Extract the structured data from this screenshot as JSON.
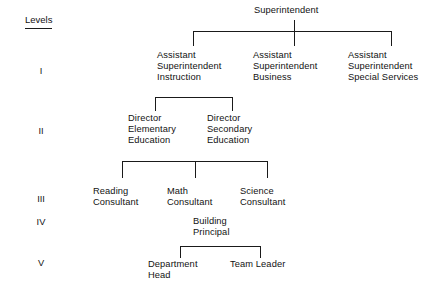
{
  "levels_header": "Levels",
  "levels": [
    {
      "numeral": "I",
      "x": 41,
      "y": 66
    },
    {
      "numeral": "II",
      "x": 41,
      "y": 126
    },
    {
      "numeral": "III",
      "x": 41,
      "y": 194
    },
    {
      "numeral": "IV",
      "x": 41,
      "y": 217
    },
    {
      "numeral": "V",
      "x": 41,
      "y": 258
    }
  ],
  "nodes": [
    {
      "id": "superintendent",
      "label": "Superintendent",
      "x": 254,
      "y": 5,
      "align": "left"
    },
    {
      "id": "asst-supt-instruction",
      "label": "Assistant\nSuperintendent\nInstruction",
      "x": 157,
      "y": 50,
      "align": "left"
    },
    {
      "id": "asst-supt-business",
      "label": "Assistant\nSuperintendent\nBusiness",
      "x": 253,
      "y": 50,
      "align": "left"
    },
    {
      "id": "asst-supt-special-services",
      "label": "Assistant\nSuperintendent\nSpecial Services",
      "x": 348,
      "y": 50,
      "align": "left"
    },
    {
      "id": "director-elementary",
      "label": "Director\nElementary\nEducation",
      "x": 128,
      "y": 113,
      "align": "left"
    },
    {
      "id": "director-secondary",
      "label": "Director\nSecondary\nEducation",
      "x": 207,
      "y": 113,
      "align": "left"
    },
    {
      "id": "reading-consultant",
      "label": "Reading\nConsultant",
      "x": 93,
      "y": 186,
      "align": "left"
    },
    {
      "id": "math-consultant",
      "label": "Math\nConsultant",
      "x": 167,
      "y": 186,
      "align": "left"
    },
    {
      "id": "science-consultant",
      "label": "Science\nConsultant",
      "x": 240,
      "y": 186,
      "align": "left"
    },
    {
      "id": "building-principal",
      "label": "Building\nPrincipal",
      "x": 193,
      "y": 216,
      "align": "left"
    },
    {
      "id": "department-head",
      "label": "Department\nHead",
      "x": 148,
      "y": 259,
      "align": "left"
    },
    {
      "id": "team-leader",
      "label": "Team Leader",
      "x": 230,
      "y": 259,
      "align": "left"
    }
  ],
  "connectors": {
    "horizontals": [
      {
        "id": "level1-bus",
        "x": 193,
        "y": 31,
        "width": 199
      },
      {
        "id": "level2-bus",
        "x": 155,
        "y": 97,
        "width": 78
      },
      {
        "id": "level3-bus",
        "x": 122,
        "y": 161,
        "width": 146
      },
      {
        "id": "level5-bus",
        "x": 180,
        "y": 246,
        "width": 81
      }
    ],
    "verticals": [
      {
        "id": "level1-drop-left",
        "x": 193,
        "y": 31,
        "height": 15
      },
      {
        "id": "level1-drop-middle",
        "x": 294,
        "y": 31,
        "height": 15
      },
      {
        "id": "level1-drop-right",
        "x": 391,
        "y": 31,
        "height": 15
      },
      {
        "id": "level1-riser",
        "x": 294,
        "y": 20,
        "height": 12
      },
      {
        "id": "level2-drop-left",
        "x": 155,
        "y": 97,
        "height": 14
      },
      {
        "id": "level2-drop-right",
        "x": 232,
        "y": 97,
        "height": 14
      },
      {
        "id": "level3-drop-left",
        "x": 122,
        "y": 161,
        "height": 17
      },
      {
        "id": "level3-drop-middle",
        "x": 195,
        "y": 161,
        "height": 17
      },
      {
        "id": "level3-drop-right",
        "x": 267,
        "y": 161,
        "height": 17
      },
      {
        "id": "level5-drop-left",
        "x": 180,
        "y": 246,
        "height": 12
      },
      {
        "id": "level5-drop-right",
        "x": 260,
        "y": 246,
        "height": 12
      }
    ]
  },
  "colors": {
    "background": "#ffffff",
    "line": "#1a1a1a",
    "text": "#121212"
  }
}
